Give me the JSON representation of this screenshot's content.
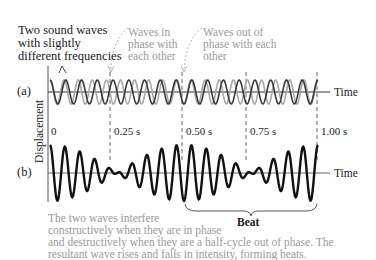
{
  "annotations": {
    "two_waves": [
      "Two sound waves",
      "with slightly",
      "different frequencies"
    ],
    "in_phase": [
      "Waves in",
      "phase with",
      "each other"
    ],
    "out_of_phase": [
      "Waves out of",
      "phase with each",
      "other"
    ]
  },
  "panels": {
    "a_label": "(a)",
    "b_label": "(b)",
    "time_label_a": "Time",
    "time_label_b": "Time"
  },
  "y_axis_label": "Displacement",
  "time_ticks": [
    "0",
    "0.25 s",
    "0.50 s",
    "0.75 s",
    "1.00 s"
  ],
  "beat_label": "Beat",
  "caption": [
    "The two waves interfere",
    "constructively when they are in phase",
    "and destructively when they are a half-cycle out of phase. The",
    "resultant wave rises and falls in intensity, forming beats."
  ],
  "colors": {
    "wave_dark": "#3a3a3a",
    "wave_light": "#a8a8a8",
    "resultant": "#111111",
    "grey_text": "#9a9a9a"
  }
}
